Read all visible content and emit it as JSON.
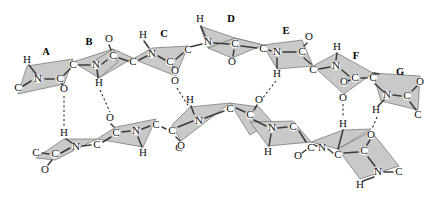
{
  "figure": {
    "background_color": "#ffffff",
    "plane_fill_color": "#c9c9c9",
    "plane_stroke_color": "#6f6f6f",
    "bond_color": "#3b3b3b",
    "hbond_color": "#2e2e2e",
    "label_color": "#000000"
  },
  "plane_labels": [
    {
      "text": "A",
      "x": 46,
      "y": 53
    },
    {
      "text": "B",
      "x": 89,
      "y": 43
    },
    {
      "text": "C",
      "x": 164,
      "y": 35
    },
    {
      "text": "D",
      "x": 231,
      "y": 20
    },
    {
      "text": "E",
      "x": 286,
      "y": 32
    },
    {
      "text": "F",
      "x": 356,
      "y": 57
    },
    {
      "text": "G",
      "x": 400,
      "y": 73
    }
  ],
  "atoms_top_chain": [
    {
      "text": "H",
      "x": 27,
      "y": 60
    },
    {
      "text": "N",
      "x": 38,
      "y": 79
    },
    {
      "text": "C",
      "x": 18,
      "y": 88
    },
    {
      "text": "C",
      "x": 60,
      "y": 79
    },
    {
      "text": "O",
      "x": 64,
      "y": 89
    },
    {
      "text": "C",
      "x": 73,
      "y": 65
    },
    {
      "text": "O",
      "x": 109,
      "y": 39
    },
    {
      "text": "N",
      "x": 96,
      "y": 65
    },
    {
      "text": "C",
      "x": 113,
      "y": 56
    },
    {
      "text": "H",
      "x": 99,
      "y": 83
    },
    {
      "text": "C",
      "x": 133,
      "y": 62
    },
    {
      "text": "H",
      "x": 143,
      "y": 35
    },
    {
      "text": "N",
      "x": 152,
      "y": 54
    },
    {
      "text": "C",
      "x": 170,
      "y": 62
    },
    {
      "text": "O",
      "x": 175,
      "y": 71
    },
    {
      "text": "C",
      "x": 188,
      "y": 50
    },
    {
      "text": "O",
      "x": 175,
      "y": 81
    },
    {
      "text": "H",
      "x": 200,
      "y": 19
    },
    {
      "text": "N",
      "x": 208,
      "y": 42
    },
    {
      "text": "C",
      "x": 235,
      "y": 44
    },
    {
      "text": "O",
      "x": 232,
      "y": 62
    },
    {
      "text": "C",
      "x": 263,
      "y": 49
    },
    {
      "text": "N",
      "x": 277,
      "y": 52
    },
    {
      "text": "O",
      "x": 309,
      "y": 37
    },
    {
      "text": "C",
      "x": 302,
      "y": 52
    },
    {
      "text": "H",
      "x": 277,
      "y": 74
    },
    {
      "text": "C",
      "x": 313,
      "y": 70
    },
    {
      "text": "H",
      "x": 337,
      "y": 47
    },
    {
      "text": "N",
      "x": 336,
      "y": 66
    },
    {
      "text": "C",
      "x": 355,
      "y": 78
    },
    {
      "text": "O",
      "x": 344,
      "y": 82
    },
    {
      "text": "C",
      "x": 373,
      "y": 78
    },
    {
      "text": "O",
      "x": 343,
      "y": 98
    },
    {
      "text": "O",
      "x": 420,
      "y": 82
    },
    {
      "text": "N",
      "x": 387,
      "y": 95
    },
    {
      "text": "C",
      "x": 407,
      "y": 96
    },
    {
      "text": "H",
      "x": 376,
      "y": 110
    },
    {
      "text": "C",
      "x": 418,
      "y": 115
    }
  ],
  "atoms_bottom_chain": [
    {
      "text": "H",
      "x": 64,
      "y": 133
    },
    {
      "text": "N",
      "x": 76,
      "y": 147
    },
    {
      "text": "C",
      "x": 36,
      "y": 153
    },
    {
      "text": "C",
      "x": 55,
      "y": 154
    },
    {
      "text": "O",
      "x": 45,
      "y": 170
    },
    {
      "text": "C",
      "x": 97,
      "y": 145
    },
    {
      "text": "O",
      "x": 110,
      "y": 118
    },
    {
      "text": "C",
      "x": 116,
      "y": 133
    },
    {
      "text": "N",
      "x": 136,
      "y": 131
    },
    {
      "text": "C",
      "x": 156,
      "y": 125
    },
    {
      "text": "H",
      "x": 143,
      "y": 153
    },
    {
      "text": "C",
      "x": 172,
      "y": 131
    },
    {
      "text": "H",
      "x": 190,
      "y": 100
    },
    {
      "text": "N",
      "x": 199,
      "y": 121
    },
    {
      "text": "C",
      "x": 179,
      "y": 148
    },
    {
      "text": "O",
      "x": 181,
      "y": 146
    },
    {
      "text": "C",
      "x": 230,
      "y": 109
    },
    {
      "text": "O",
      "x": 259,
      "y": 100
    },
    {
      "text": "C",
      "x": 250,
      "y": 115
    },
    {
      "text": "N",
      "x": 272,
      "y": 128
    },
    {
      "text": "C",
      "x": 293,
      "y": 127
    },
    {
      "text": "H",
      "x": 268,
      "y": 152
    },
    {
      "text": "C",
      "x": 311,
      "y": 148
    },
    {
      "text": "O",
      "x": 298,
      "y": 156
    },
    {
      "text": "N",
      "x": 322,
      "y": 148
    },
    {
      "text": "H",
      "x": 343,
      "y": 124
    },
    {
      "text": "C",
      "x": 338,
      "y": 155
    },
    {
      "text": "O",
      "x": 371,
      "y": 135
    },
    {
      "text": "C",
      "x": 364,
      "y": 151
    },
    {
      "text": "N",
      "x": 378,
      "y": 172
    },
    {
      "text": "C",
      "x": 399,
      "y": 172
    },
    {
      "text": "H",
      "x": 360,
      "y": 185
    }
  ],
  "hydrogen_bonds": [
    {
      "from_atom": "O",
      "to_atom": "H",
      "x1": 64,
      "y1": 96,
      "x2": 64,
      "y2": 126
    },
    {
      "from_atom": "H",
      "to_atom": "O",
      "x1": 100,
      "y1": 90,
      "x2": 110,
      "y2": 112
    },
    {
      "from_atom": "O",
      "to_atom": "H",
      "x1": 177,
      "y1": 88,
      "x2": 189,
      "y2": 107
    },
    {
      "from_atom": "O",
      "to_atom": "H",
      "x1": 276,
      "y1": 81,
      "x2": 262,
      "y2": 99
    },
    {
      "from_atom": "O",
      "to_atom": "H",
      "x1": 343,
      "y1": 104,
      "x2": 343,
      "y2": 118
    },
    {
      "from_atom": "H",
      "to_atom": "O",
      "x1": 376,
      "y1": 117,
      "x2": 371,
      "y2": 129
    }
  ]
}
